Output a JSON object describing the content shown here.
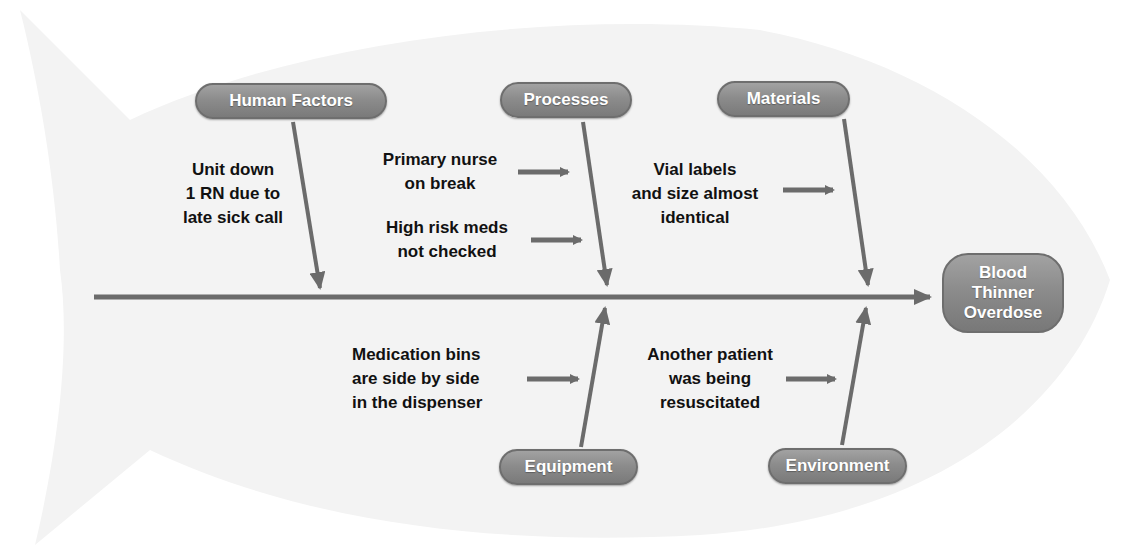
{
  "diagram": {
    "type": "fishbone",
    "colors": {
      "pill_fill": "#8c8c8c",
      "pill_border": "#6e6e6e",
      "line": "#6b6b6b",
      "text": "#111111",
      "fish_bg": "#f4f4f4"
    },
    "effect": {
      "lines": [
        "Blood",
        "Thinner",
        "Overdose"
      ]
    },
    "categories": {
      "human_factors": {
        "label": "Human Factors",
        "causes": [
          {
            "lines": [
              "Unit down",
              "1 RN due to",
              "late sick call"
            ]
          }
        ]
      },
      "processes": {
        "label": "Processes",
        "causes": [
          {
            "lines": [
              "Primary nurse",
              "on break"
            ]
          },
          {
            "lines": [
              "High risk meds",
              "not checked"
            ]
          }
        ]
      },
      "materials": {
        "label": "Materials",
        "causes": [
          {
            "lines": [
              "Vial labels",
              "and size almost",
              "identical"
            ]
          }
        ]
      },
      "equipment": {
        "label": "Equipment",
        "causes": [
          {
            "lines": [
              "Medication bins",
              "are side by side",
              "in the dispenser"
            ]
          }
        ]
      },
      "environment": {
        "label": "Environment",
        "causes": [
          {
            "lines": [
              "Another patient",
              "was being",
              "resuscitated"
            ]
          }
        ]
      }
    }
  }
}
